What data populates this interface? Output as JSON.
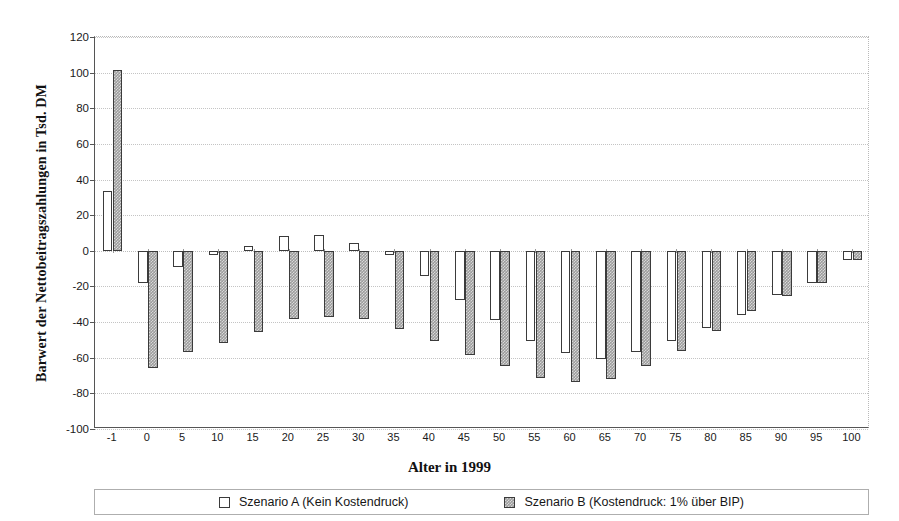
{
  "chart_data": {
    "type": "bar",
    "title": "",
    "xlabel": "Alter in 1999",
    "ylabel": "Barwert der Nettobeitragszahlungen in Tsd. DM",
    "categories": [
      "-1",
      "0",
      "5",
      "10",
      "15",
      "20",
      "25",
      "30",
      "35",
      "40",
      "45",
      "50",
      "55",
      "60",
      "65",
      "70",
      "75",
      "80",
      "85",
      "90",
      "95",
      "100"
    ],
    "ylim": [
      -100,
      120
    ],
    "ytick_step": 20,
    "yticks": [
      "120",
      "100",
      "80",
      "60",
      "40",
      "20",
      "0",
      "-20",
      "-40",
      "-60",
      "-80",
      "-100"
    ],
    "grid": true,
    "legend_position": "bottom",
    "series": [
      {
        "name": "Szenario A (Kein Kostendruck)",
        "style": "white-outlined",
        "color": "#ffffff",
        "values": [
          33.5,
          -18,
          -9,
          -2.5,
          2.5,
          8.5,
          9,
          4.5,
          -2.5,
          -14,
          -27.5,
          -39,
          -50.5,
          -57.5,
          -60.5,
          -57,
          -50.5,
          -43.5,
          -36,
          -25,
          -18,
          -5
        ]
      },
      {
        "name": "Szenario B (Kostendruck: 1% über BIP)",
        "style": "gray-hatched",
        "color": "#9c9c9c",
        "values": [
          101.5,
          -65.5,
          -57,
          -51.5,
          -45.5,
          -38,
          -37,
          -38,
          -44,
          -50.5,
          -58.5,
          -64.5,
          -71.5,
          -73.5,
          -72,
          -64.5,
          -56,
          -45,
          -33.5,
          -25.5,
          -18,
          -5
        ]
      }
    ]
  },
  "legend": {
    "items": [
      {
        "label": "Szenario A (Kein Kostendruck)",
        "swatch": "white-square-icon"
      },
      {
        "label": "Szenario B (Kostendruck: 1% über BIP)",
        "swatch": "gray-square-icon"
      }
    ]
  }
}
